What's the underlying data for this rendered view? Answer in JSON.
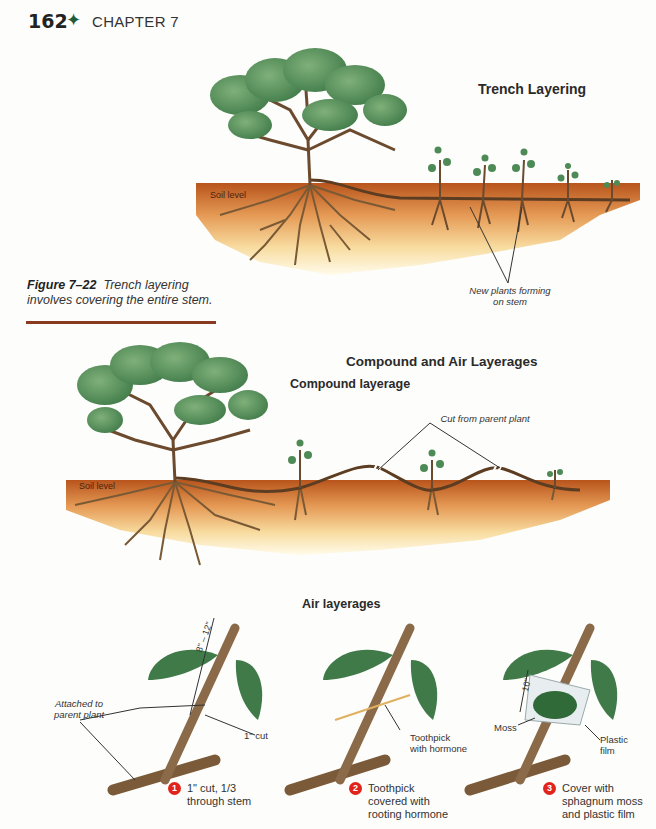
{
  "header": {
    "page_number": "162",
    "separator_icon": "✦",
    "chapter": "CHAPTER 7"
  },
  "figure": {
    "number": "Figure 7–22",
    "caption": "Trench layering involves covering the entire stem.",
    "rule_color": "#8a3a1e"
  },
  "trench": {
    "title": "Trench Layering",
    "soil_label": "Soil level",
    "callout": [
      "New plants forming",
      "on stem"
    ]
  },
  "compound_air": {
    "title": "Compound and Air Layerages",
    "compound_subtitle": "Compound layerage",
    "soil_label": "Soil level",
    "cut_callout": "Cut from parent plant",
    "air_subtitle": "Air layerages"
  },
  "air_layerage": {
    "panel1": {
      "measure": "8\" – 12\"",
      "attached_label": [
        "Attached to",
        "parent plant"
      ],
      "cut_label": "1\" cut",
      "step_number": "1",
      "step_text": [
        "1\" cut, 1/3",
        "through stem"
      ]
    },
    "panel2": {
      "toothpick_label": [
        "Toothpick",
        "with hormone"
      ],
      "step_number": "2",
      "step_text": [
        "Toothpick",
        "covered with",
        "rooting hormone"
      ]
    },
    "panel3": {
      "measure": "10\"",
      "moss_label": "Moss",
      "plastic_label": [
        "Plastic",
        "film"
      ],
      "step_number": "3",
      "step_text": [
        "Cover with",
        "sphagnum moss",
        "and plastic film"
      ]
    }
  },
  "colors": {
    "soil_top": "#b8541c",
    "soil_bottom": "#fdf3c8",
    "leaf": "#4e8a55",
    "stem": "#6b4a2e",
    "step_badge": "#e0241b",
    "accent_green": "#1e5c3a"
  }
}
